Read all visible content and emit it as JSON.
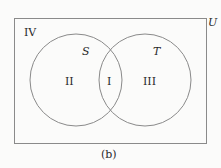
{
  "diagram": {
    "type": "venn",
    "universe_label": "U",
    "sets": [
      {
        "name": "S"
      },
      {
        "name": "T"
      }
    ],
    "regions": {
      "intersection": "I",
      "s_only": "II",
      "t_only": "III",
      "outside": "IV"
    },
    "caption": "(b)",
    "stroke_color": "#8a8a8a",
    "text_color": "#2a2a2a"
  }
}
